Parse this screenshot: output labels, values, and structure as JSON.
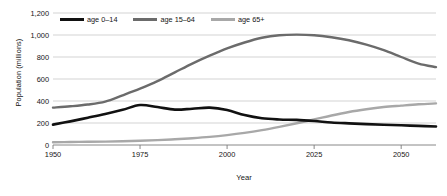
{
  "chart_data": {
    "type": "line",
    "title": "",
    "xlabel": "Year",
    "ylabel": "Population (millions)",
    "xlim": [
      1950,
      2060
    ],
    "ylim": [
      0,
      1200
    ],
    "xticks": [
      "1950",
      "1975",
      "2000",
      "2025",
      "2050"
    ],
    "xtick_values": [
      1950,
      1975,
      2000,
      2025,
      2050
    ],
    "yticks": [
      "0",
      "200",
      "400",
      "600",
      "800",
      "1,000",
      "1,200"
    ],
    "ytick_values": [
      0,
      200,
      400,
      600,
      800,
      1000,
      1200
    ],
    "grid": "horizontal",
    "legend_position": "top-left-inside",
    "x": [
      1950,
      1955,
      1960,
      1965,
      1970,
      1975,
      1980,
      1985,
      1990,
      1995,
      2000,
      2005,
      2010,
      2015,
      2020,
      2025,
      2030,
      2035,
      2040,
      2045,
      2050,
      2055,
      2060
    ],
    "series": [
      {
        "name": "age 0–14",
        "color": "#111111",
        "width": 2.6,
        "values": [
          185,
          215,
          248,
          282,
          320,
          363,
          345,
          322,
          330,
          340,
          318,
          272,
          243,
          232,
          228,
          218,
          205,
          197,
          190,
          184,
          179,
          174,
          168
        ]
      },
      {
        "name": "age 15–64",
        "color": "#6b6b6b",
        "width": 2.4,
        "values": [
          340,
          352,
          368,
          395,
          452,
          512,
          580,
          660,
          740,
          812,
          878,
          932,
          975,
          998,
          1003,
          998,
          980,
          952,
          912,
          862,
          800,
          740,
          708
        ]
      },
      {
        "name": "age 65+",
        "color": "#a8a8a8",
        "width": 2.4,
        "values": [
          25,
          27,
          29,
          31,
          34,
          38,
          44,
          52,
          62,
          74,
          90,
          110,
          135,
          165,
          198,
          232,
          268,
          300,
          325,
          345,
          358,
          370,
          378
        ]
      }
    ]
  },
  "legend": {
    "items": [
      {
        "label": "age 0–14",
        "color": "#111111"
      },
      {
        "label": "age 15–64",
        "color": "#6b6b6b"
      },
      {
        "label": "age 65+",
        "color": "#a8a8a8"
      }
    ]
  },
  "axes": {
    "y_title": "Population (millions)",
    "x_title": "Year"
  },
  "colors": {
    "grid": "#c8c8c8",
    "axis": "#7a7a7a",
    "text": "#151515",
    "background": "#ffffff"
  }
}
